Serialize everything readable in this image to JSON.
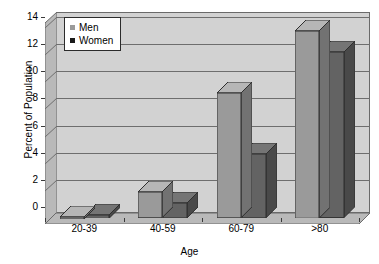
{
  "chart_data": {
    "type": "bar",
    "title": "",
    "xlabel": "Age",
    "ylabel": "Percent of Population",
    "categories": [
      "20-39",
      "40-59",
      "60-79",
      ">80"
    ],
    "series": [
      {
        "name": "Men",
        "color": "#9a9a9a",
        "values": [
          0.15,
          1.9,
          9.2,
          13.8
        ]
      },
      {
        "name": "Women",
        "color": "#636363",
        "values": [
          0.25,
          1.1,
          4.7,
          12.2
        ]
      }
    ],
    "ylim": [
      0,
      14
    ],
    "yticks": [
      0,
      2,
      4,
      6,
      8,
      10,
      12,
      14
    ],
    "ytick_labels": [
      "0",
      "2",
      "4",
      "6",
      "8",
      "10",
      "12",
      "14"
    ],
    "grid": true,
    "legend_position": "top-left",
    "style": "3d-column",
    "plot_background": "#d2d2d2",
    "figure_background": "#ffffff",
    "axis_color": "#3a3a3a",
    "gridline_color": "#6e6e6e"
  },
  "legend": {
    "items": [
      {
        "label": "Men",
        "marker": "square-gray",
        "color": "#9a9a9a"
      },
      {
        "label": "Women",
        "marker": "square-black",
        "color": "#1a1a1a"
      }
    ]
  }
}
